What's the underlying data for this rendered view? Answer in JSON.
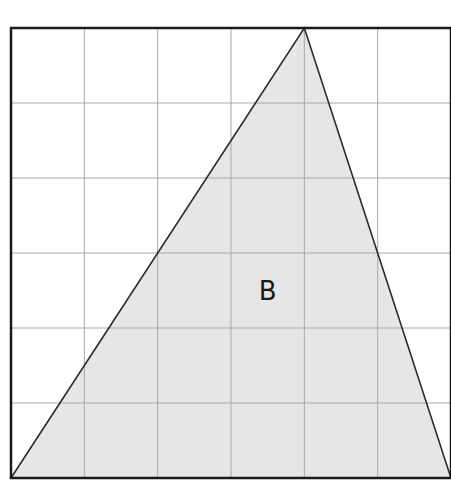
{
  "diagram": {
    "grid": {
      "cols": 6,
      "rows": 6,
      "left": 11,
      "top": 28,
      "right": 451,
      "bottom": 478
    },
    "colors": {
      "border": "#1a1a1a",
      "grid": "#a8a8a8",
      "fill": "#e6e6e6",
      "edge": "#2a2a2a",
      "text": "#1a1a1a"
    },
    "triangle": {
      "label": "B",
      "vertices": [
        [
          0,
          0
        ],
        [
          4,
          6
        ],
        [
          6,
          0
        ]
      ],
      "label_position": [
        3.5,
        2.5
      ]
    }
  }
}
